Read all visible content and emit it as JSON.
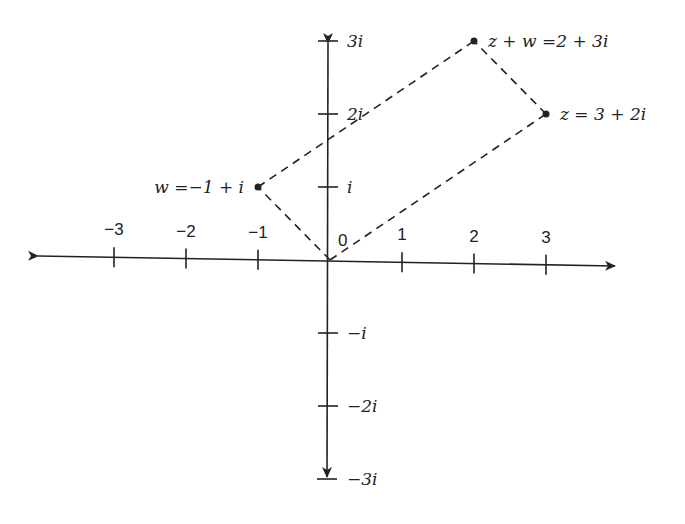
{
  "axes": {
    "real_ticks": [
      {
        "value": -3,
        "label": "−3"
      },
      {
        "value": -2,
        "label": "−2"
      },
      {
        "value": -1,
        "label": "−1"
      },
      {
        "value": 1,
        "label": "1"
      },
      {
        "value": 2,
        "label": "2"
      },
      {
        "value": 3,
        "label": "3"
      }
    ],
    "imag_ticks": [
      {
        "value": 3,
        "label": "3i"
      },
      {
        "value": 2,
        "label": "2i"
      },
      {
        "value": 1,
        "label": "i"
      },
      {
        "value": -1,
        "label": "−i"
      },
      {
        "value": -2,
        "label": "−2i"
      },
      {
        "value": -3,
        "label": "−3i"
      }
    ],
    "origin_label": "0",
    "real_range": [
      -3,
      3
    ],
    "imag_range": [
      -3,
      3
    ]
  },
  "points": [
    {
      "id": "w",
      "re": -1,
      "im": 1,
      "label": "w =−1 + i",
      "anchor": "left"
    },
    {
      "id": "z",
      "re": 3,
      "im": 2,
      "label": "z = 3 + 2i",
      "anchor": "right"
    },
    {
      "id": "zw",
      "re": 2,
      "im": 3,
      "label": "z + w =2 + 3i",
      "anchor": "right"
    }
  ],
  "dashed_segments": [
    {
      "from": [
        0,
        0
      ],
      "to": [
        -1,
        1
      ]
    },
    {
      "from": [
        0,
        0
      ],
      "to": [
        3,
        2
      ]
    },
    {
      "from": [
        -1,
        1
      ],
      "to": [
        2,
        3
      ]
    },
    {
      "from": [
        3,
        2
      ],
      "to": [
        2,
        3
      ]
    }
  ],
  "colors": {
    "ink": "#222222",
    "background": "#ffffff"
  }
}
